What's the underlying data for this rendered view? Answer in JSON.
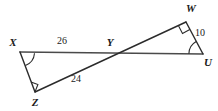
{
  "figure": {
    "type": "geometry-diagram",
    "background_color": "#ffffff",
    "line_color": "#4a4a4a",
    "text_color": "#1a1a1a"
  },
  "vertices": {
    "X": {
      "label": "X",
      "x": 20,
      "y": 52,
      "label_x": 13,
      "label_y": 46
    },
    "Y": {
      "label": "Y",
      "x": 110,
      "y": 53,
      "label_x": 110,
      "label_y": 46
    },
    "Z": {
      "label": "Z",
      "x": 35,
      "y": 92,
      "label_x": 35,
      "label_y": 106
    },
    "W": {
      "label": "W",
      "x": 186,
      "y": 22,
      "label_x": 191,
      "label_y": 12
    },
    "U": {
      "label": "U",
      "x": 203,
      "y": 54,
      "label_x": 208,
      "label_y": 66
    }
  },
  "segments": [
    {
      "name": "segment-XU",
      "from": "X",
      "to": "U"
    },
    {
      "name": "segment-ZW",
      "from": "Z",
      "to": "W"
    },
    {
      "name": "segment-XZ",
      "from": "X",
      "to": "Z"
    },
    {
      "name": "segment-WU",
      "from": "W",
      "to": "U"
    }
  ],
  "measures": {
    "XY": {
      "value": "26",
      "x": 62,
      "y": 44
    },
    "ZY": {
      "value": "24",
      "x": 76,
      "y": 82
    },
    "WU": {
      "value": "10",
      "x": 200,
      "y": 36
    }
  },
  "angle_marks": [
    {
      "name": "angle-arc-X",
      "vertex": "X",
      "kind": "arc"
    },
    {
      "name": "right-angle-Z",
      "vertex": "Z",
      "kind": "right-angle"
    },
    {
      "name": "right-angle-W",
      "vertex": "W",
      "kind": "right-angle"
    },
    {
      "name": "angle-arc-U",
      "vertex": "U",
      "kind": "arc"
    }
  ]
}
